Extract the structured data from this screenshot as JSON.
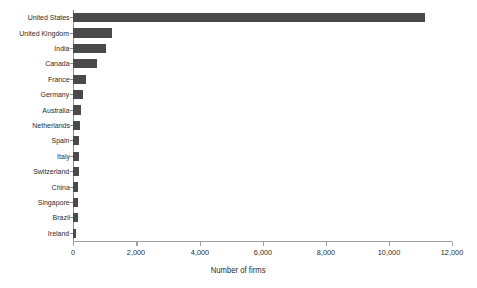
{
  "chart_data": {
    "type": "bar",
    "orientation": "horizontal",
    "title": "",
    "xlabel": "Number of firms",
    "ylabel": "",
    "xlim": [
      0,
      12000
    ],
    "xticks": [
      0,
      2000,
      4000,
      6000,
      8000,
      10000,
      12000
    ],
    "xtick_labels": [
      "0",
      "2,000",
      "4,000",
      "6,000",
      "8,000",
      "10,000",
      "12,000"
    ],
    "grid": false,
    "legend": null,
    "bar_color": "#4a4a4a",
    "axis_color": "#8c8c8c",
    "categories": [
      "United States",
      "United Kingdom",
      "India",
      "Canada",
      "France",
      "Germany",
      "Australia",
      "Netherlands",
      "Spain",
      "Italy",
      "Switzerland",
      "China",
      "Singapore",
      "Brazil",
      "Ireland"
    ],
    "values": [
      11150,
      1225,
      1035,
      740,
      400,
      315,
      245,
      200,
      185,
      180,
      170,
      160,
      150,
      135,
      100
    ]
  }
}
